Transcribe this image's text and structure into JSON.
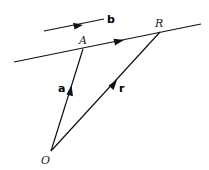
{
  "diagram": {
    "points": [
      {
        "id": "O",
        "label": "O",
        "x": 51,
        "y": 151,
        "lx": 41,
        "ly": 164
      },
      {
        "id": "A",
        "label": "A",
        "x": 83,
        "y": 49,
        "lx": 79,
        "ly": 44
      },
      {
        "id": "R",
        "label": "R",
        "x": 160,
        "y": 32,
        "lx": 155,
        "ly": 27
      }
    ],
    "vectors": [
      {
        "id": "a",
        "label": "a",
        "from": "O",
        "to": "A",
        "lx": 58,
        "ly": 92
      },
      {
        "id": "r",
        "label": "r",
        "from": "O",
        "to": "R",
        "lx": 119,
        "ly": 92
      },
      {
        "id": "b",
        "label": "b",
        "x1": 44,
        "y1": 31,
        "x2": 104,
        "y2": 19,
        "lx": 107,
        "ly": 23
      }
    ],
    "line": {
      "label": "line through A parallel to b",
      "x1": 14,
      "y1": 62,
      "x2": 201,
      "y2": 24
    },
    "colors": {
      "stroke": "#111111",
      "background": "#ffffff"
    }
  }
}
